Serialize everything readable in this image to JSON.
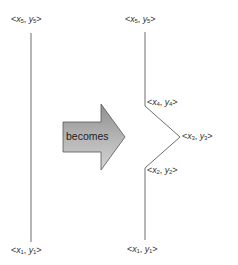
{
  "diagram": {
    "title": "",
    "arrow": {
      "label": "becomes",
      "fill_top": "#9a9a9a",
      "fill_bottom": "#d0d0d0",
      "stroke": "#555555"
    },
    "line_color": "#6e6e6e",
    "left_polyline": {
      "points": [
        [
          31,
          33
        ],
        [
          31,
          242
        ]
      ],
      "labels": {
        "top": {
          "var_x": "x",
          "sub_x": "5",
          "var_y": "y",
          "sub_y": "5"
        },
        "bottom": {
          "var_x": "x",
          "sub_x": "1",
          "var_y": "y",
          "sub_y": "1"
        }
      }
    },
    "right_polyline": {
      "points": [
        [
          145,
          32
        ],
        [
          145,
          106
        ],
        [
          180,
          137
        ],
        [
          145,
          168
        ],
        [
          145,
          240
        ]
      ],
      "labels": {
        "p5": {
          "var_x": "x",
          "sub_x": "5",
          "var_y": "y",
          "sub_y": "5"
        },
        "p4": {
          "var_x": "x",
          "sub_x": "4",
          "var_y": "y",
          "sub_y": "4"
        },
        "p3": {
          "var_x": "x",
          "sub_x": "3",
          "var_y": "y",
          "sub_y": "3"
        },
        "p2": {
          "var_x": "x",
          "sub_x": "2",
          "var_y": "y",
          "sub_y": "2"
        },
        "p1": {
          "var_x": "x",
          "sub_x": "1",
          "var_y": "y",
          "sub_y": "1"
        }
      }
    }
  }
}
